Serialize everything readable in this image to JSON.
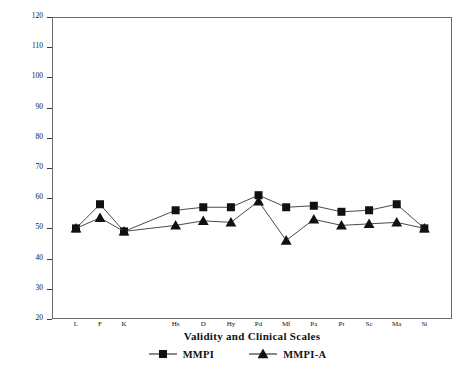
{
  "chart_data": {
    "type": "line",
    "title": "",
    "xlabel": "Validity and Clinical Scales",
    "ylabel": "T - Scores",
    "ylim": [
      20,
      120
    ],
    "yticks": [
      20,
      30,
      40,
      50,
      60,
      70,
      80,
      90,
      100,
      110,
      120
    ],
    "ytick_labels": [
      "20",
      "30",
      "40",
      "50",
      "60",
      "70",
      "80",
      "90",
      "100",
      "110",
      "120"
    ],
    "grid": false,
    "reference_lines": [
      {
        "value": 65,
        "name": "clinical-cutoff-65"
      },
      {
        "value": 50,
        "name": "mean-line-50"
      }
    ],
    "vertical_divider_after_category": "K",
    "categories": [
      "L",
      "F",
      "K",
      "Hs",
      "D",
      "Hy",
      "Pd",
      "Mf",
      "Pa",
      "Pt",
      "Sc",
      "Ma",
      "Si"
    ],
    "category_groups": [
      {
        "name": "Validity",
        "categories": [
          "L",
          "F",
          "K"
        ]
      },
      {
        "name": "Clinical",
        "categories": [
          "Hs",
          "D",
          "Hy",
          "Pd",
          "Mf",
          "Pa",
          "Pt",
          "Sc",
          "Ma",
          "Si"
        ]
      }
    ],
    "legend_position": "bottom",
    "series": [
      {
        "name": "MMPI",
        "marker": "square",
        "color": "#111111",
        "values": [
          50,
          58,
          49,
          56,
          57,
          57,
          61,
          57,
          57.5,
          55.5,
          56,
          58,
          50
        ]
      },
      {
        "name": "MMPI-A",
        "marker": "triangle",
        "color": "#111111",
        "values": [
          50,
          53.5,
          49,
          51,
          52.5,
          52,
          59,
          46,
          53,
          51,
          51.5,
          52,
          50
        ]
      }
    ]
  },
  "legend": {
    "items": [
      {
        "label": "MMPI",
        "marker": "square"
      },
      {
        "label": "MMPI-A",
        "marker": "triangle"
      }
    ]
  }
}
